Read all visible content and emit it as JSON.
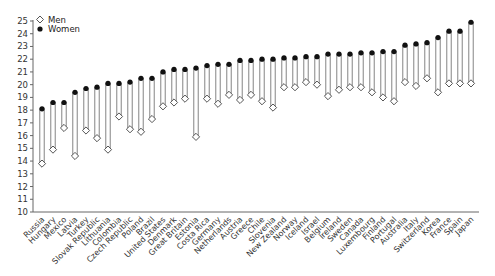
{
  "chart_data": {
    "type": "dot-range",
    "title": "",
    "xlabel": "",
    "ylabel": "",
    "ylim": [
      10,
      25
    ],
    "yticks": [
      10,
      11,
      12,
      13,
      14,
      15,
      16,
      17,
      18,
      19,
      20,
      21,
      22,
      23,
      24,
      25
    ],
    "grid": false,
    "legend": {
      "position": "top-left",
      "entries": [
        {
          "name": "Men",
          "marker": "open-diamond"
        },
        {
          "name": "Women",
          "marker": "filled-circle"
        }
      ]
    },
    "categories": [
      "Russia",
      "Hungary",
      "Mexico",
      "Latvia",
      "Turkey",
      "Slovak Republic",
      "Lithuania",
      "Colombia",
      "Czech Republic",
      "Poland",
      "Brazil",
      "United States",
      "Denmark",
      "Great Britain",
      "Estonia",
      "Costa Rica",
      "Germany",
      "Netherlands",
      "Austria",
      "Greece",
      "Chile",
      "Slovenia",
      "New Zealand",
      "Norway",
      "Iceland",
      "Israel",
      "Belgium",
      "Ireland",
      "Sweden",
      "Canada",
      "Luxembourg",
      "Finland",
      "Portugal",
      "Australia",
      "Italy",
      "Switzerland",
      "Korea",
      "France",
      "Spain",
      "Japan"
    ],
    "series": [
      {
        "name": "Men",
        "values": [
          13.8,
          14.9,
          16.6,
          14.4,
          16.4,
          15.8,
          14.9,
          17.5,
          16.5,
          16.3,
          17.3,
          18.3,
          18.6,
          18.9,
          15.9,
          18.9,
          18.5,
          19.2,
          18.8,
          19.2,
          18.7,
          18.2,
          19.8,
          19.8,
          20.2,
          20.0,
          19.1,
          19.6,
          19.8,
          19.8,
          19.4,
          19.0,
          18.7,
          20.2,
          19.9,
          20.5,
          19.4,
          20.1,
          20.1,
          20.1
        ]
      },
      {
        "name": "Women",
        "values": [
          18.1,
          18.6,
          18.6,
          19.4,
          19.7,
          19.8,
          20.1,
          20.1,
          20.2,
          20.5,
          20.5,
          21.0,
          21.2,
          21.2,
          21.3,
          21.5,
          21.6,
          21.6,
          21.9,
          21.9,
          22.0,
          22.0,
          22.1,
          22.1,
          22.2,
          22.2,
          22.4,
          22.4,
          22.4,
          22.5,
          22.5,
          22.6,
          22.6,
          23.1,
          23.2,
          23.3,
          23.7,
          24.2,
          24.2,
          24.9
        ]
      }
    ]
  }
}
